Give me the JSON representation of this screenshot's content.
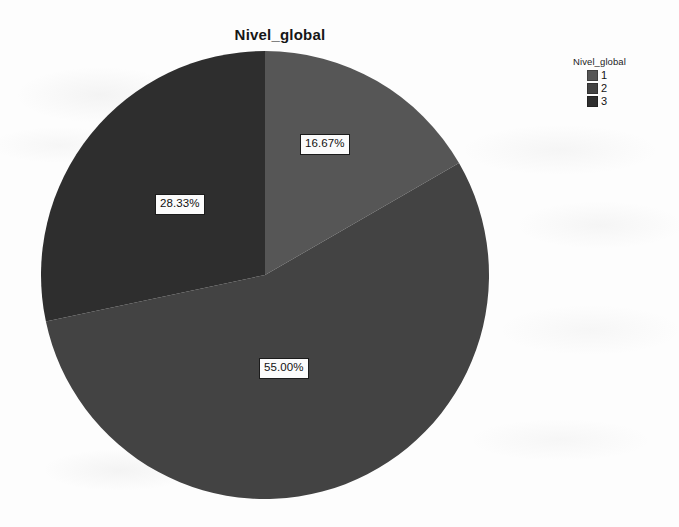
{
  "chart_data": {
    "type": "pie",
    "title": "Nivel_global",
    "categories": [
      "1",
      "2",
      "3"
    ],
    "values": [
      16.67,
      55.0,
      28.33
    ],
    "value_labels": [
      "16.67%",
      "55.00%",
      "28.33%"
    ],
    "unit": "percent",
    "start_angle_deg": 0,
    "direction": "clockwise",
    "slice_colors": [
      "#565656",
      "#434343",
      "#2e2e2e"
    ],
    "xlabel": "",
    "ylabel": "",
    "grid": false,
    "legend": {
      "position": "right",
      "title": "Nivel_global",
      "entries": [
        {
          "label": "1",
          "color": "#565656",
          "value": 16.67
        },
        {
          "label": "2",
          "color": "#434343",
          "value": 55.0
        },
        {
          "label": "3",
          "color": "#2e2e2e",
          "value": 28.33
        }
      ]
    }
  },
  "chart": {
    "title": "Nivel_global",
    "slices": [
      {
        "name": "1",
        "percent_label": "16.67%"
      },
      {
        "name": "2",
        "percent_label": "55.00%"
      },
      {
        "name": "3",
        "percent_label": "28.33%"
      }
    ]
  },
  "legend": {
    "title": "Nivel_global",
    "items": [
      {
        "label": "1"
      },
      {
        "label": "2"
      },
      {
        "label": "3"
      }
    ]
  },
  "colors": {
    "slice_1": "#565656",
    "slice_2": "#434343",
    "slice_3": "#2e2e2e",
    "background": "#fdfdfd",
    "text": "#141414"
  }
}
